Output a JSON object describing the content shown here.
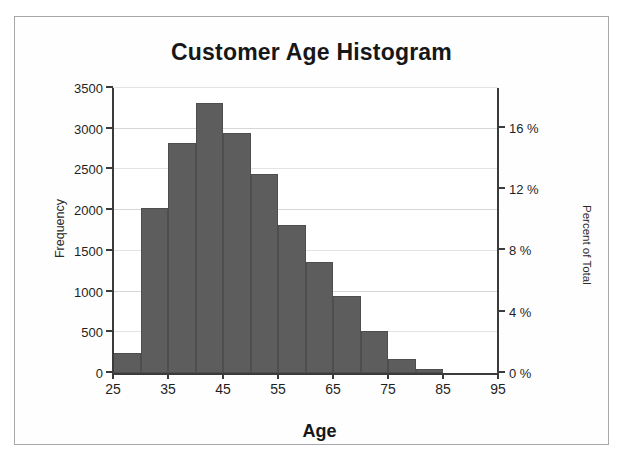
{
  "chart_data": {
    "type": "bar",
    "title": "Customer Age Histogram",
    "xlabel": "Age",
    "ylabel": "Frequency",
    "y2label": "Percent of Total",
    "grid": true,
    "legend": "none",
    "bin_width": 5,
    "bin_edges": [
      25,
      30,
      35,
      40,
      45,
      50,
      55,
      60,
      65,
      70,
      75,
      80,
      85
    ],
    "categories": [
      "25-30",
      "30-35",
      "35-40",
      "40-45",
      "45-50",
      "50-55",
      "55-60",
      "60-65",
      "65-70",
      "70-75",
      "75-80",
      "80-85"
    ],
    "values": [
      240,
      2030,
      2830,
      3310,
      2950,
      2450,
      1820,
      1360,
      940,
      510,
      170,
      55
    ],
    "percent_values": [
      1.3,
      10.8,
      15.1,
      17.6,
      15.7,
      13.0,
      9.7,
      7.2,
      5.0,
      2.7,
      0.9,
      0.3
    ],
    "xlim": [
      25,
      95
    ],
    "ylim": [
      0,
      3500
    ],
    "y2lim": [
      0,
      18.6
    ],
    "xticks": [
      25,
      35,
      45,
      55,
      65,
      75,
      85,
      95
    ],
    "xticklabels": [
      "25",
      "35",
      "45",
      "55",
      "65",
      "75",
      "85",
      "95"
    ],
    "yticks": [
      0,
      500,
      1000,
      1500,
      2000,
      2500,
      3000,
      3500
    ],
    "yticklabels": [
      "0",
      "500",
      "1000",
      "1500",
      "2000",
      "2500",
      "3000",
      "3500"
    ],
    "y2ticks": [
      0,
      4,
      8,
      12,
      16
    ],
    "y2ticklabels": [
      "0 %",
      "4 %",
      "8 %",
      "12 %",
      "16 %"
    ],
    "bar_color": "#5d5d5d",
    "bar_edge_color": "#4e4e4e",
    "grid_color": "#d7d7d9",
    "axis_color": "#3b3b3b",
    "background": "#ffffff",
    "frame_color": "#a8a8ab"
  }
}
